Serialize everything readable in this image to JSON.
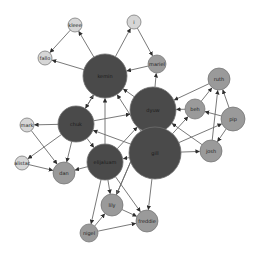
{
  "diagram": {
    "type": "directed-network-graph",
    "colors": {
      "hub": "#4a4a4a",
      "medium": "#9a9a9a",
      "light": "#d6d6d6",
      "stroke": "#6e6e6e",
      "edge": "#6a6a6a"
    },
    "nodes": [
      {
        "id": "kemin",
        "label": "kemin",
        "x": 105,
        "y": 76,
        "r": 22,
        "tier": "hub"
      },
      {
        "id": "dyuw",
        "label": "dyuw",
        "x": 153,
        "y": 110,
        "r": 23,
        "tier": "hub"
      },
      {
        "id": "chuk",
        "label": "chuk",
        "x": 76,
        "y": 124,
        "r": 18,
        "tier": "hub"
      },
      {
        "id": "elijaluam",
        "label": "elijaluam",
        "x": 105,
        "y": 162,
        "r": 18,
        "tier": "hub"
      },
      {
        "id": "gill",
        "label": "gill",
        "x": 155,
        "y": 153,
        "r": 26,
        "tier": "hub"
      },
      {
        "id": "kleee",
        "label": "kleee",
        "x": 75,
        "y": 25,
        "r": 7,
        "tier": "light"
      },
      {
        "id": "fallo",
        "label": "fallo",
        "x": 45,
        "y": 58,
        "r": 7,
        "tier": "light"
      },
      {
        "id": "i",
        "label": "i",
        "x": 134,
        "y": 22,
        "r": 7,
        "tier": "light"
      },
      {
        "id": "mariel",
        "label": "mariel",
        "x": 157,
        "y": 64,
        "r": 9,
        "tier": "medium"
      },
      {
        "id": "ruth",
        "label": "ruth",
        "x": 219,
        "y": 79,
        "r": 11,
        "tier": "medium"
      },
      {
        "id": "beh",
        "label": "beh",
        "x": 195,
        "y": 109,
        "r": 10,
        "tier": "medium"
      },
      {
        "id": "pip",
        "label": "pip",
        "x": 233,
        "y": 119,
        "r": 12,
        "tier": "medium"
      },
      {
        "id": "josh",
        "label": "josh",
        "x": 211,
        "y": 151,
        "r": 11,
        "tier": "medium"
      },
      {
        "id": "mark",
        "label": "mark",
        "x": 27,
        "y": 125,
        "r": 7,
        "tier": "light"
      },
      {
        "id": "alistar",
        "label": "alistar",
        "x": 22,
        "y": 163,
        "r": 7,
        "tier": "light"
      },
      {
        "id": "dan",
        "label": "dan",
        "x": 64,
        "y": 173,
        "r": 11,
        "tier": "medium"
      },
      {
        "id": "lily",
        "label": "lily",
        "x": 112,
        "y": 205,
        "r": 11,
        "tier": "medium"
      },
      {
        "id": "nigel",
        "label": "nigel",
        "x": 89,
        "y": 233,
        "r": 9,
        "tier": "medium"
      },
      {
        "id": "freddie",
        "label": "freddie",
        "x": 147,
        "y": 221,
        "r": 11,
        "tier": "medium"
      }
    ],
    "edges": [
      {
        "from": "kleee",
        "to": "fallo"
      },
      {
        "from": "kemin",
        "to": "fallo"
      },
      {
        "from": "kemin",
        "to": "kleee"
      },
      {
        "from": "kemin",
        "to": "i"
      },
      {
        "from": "i",
        "to": "mariel"
      },
      {
        "from": "mariel",
        "to": "kemin"
      },
      {
        "from": "dyuw",
        "to": "mariel"
      },
      {
        "from": "dyuw",
        "to": "kemin"
      },
      {
        "from": "chuk",
        "to": "kemin"
      },
      {
        "from": "elijaluam",
        "to": "kemin"
      },
      {
        "from": "gill",
        "to": "kemin"
      },
      {
        "from": "kemin",
        "to": "chuk"
      },
      {
        "from": "chuk",
        "to": "dyuw"
      },
      {
        "from": "chuk",
        "to": "mark"
      },
      {
        "from": "chuk",
        "to": "alistar"
      },
      {
        "from": "chuk",
        "to": "dan"
      },
      {
        "from": "chuk",
        "to": "elijaluam"
      },
      {
        "from": "mark",
        "to": "dan"
      },
      {
        "from": "alistar",
        "to": "dan"
      },
      {
        "from": "elijaluam",
        "to": "dan"
      },
      {
        "from": "elijaluam",
        "to": "dyuw"
      },
      {
        "from": "gill",
        "to": "chuk"
      },
      {
        "from": "gill",
        "to": "dyuw"
      },
      {
        "from": "gill",
        "to": "elijaluam"
      },
      {
        "from": "gill",
        "to": "josh"
      },
      {
        "from": "gill",
        "to": "pip"
      },
      {
        "from": "gill",
        "to": "beh"
      },
      {
        "from": "gill",
        "to": "freddie"
      },
      {
        "from": "ruth",
        "to": "dyuw"
      },
      {
        "from": "beh",
        "to": "ruth"
      },
      {
        "from": "beh",
        "to": "dyuw"
      },
      {
        "from": "pip",
        "to": "ruth"
      },
      {
        "from": "pip",
        "to": "beh"
      },
      {
        "from": "pip",
        "to": "josh"
      },
      {
        "from": "josh",
        "to": "ruth"
      },
      {
        "from": "josh",
        "to": "dyuw"
      },
      {
        "from": "elijaluam",
        "to": "lily"
      },
      {
        "from": "elijaluam",
        "to": "nigel"
      },
      {
        "from": "elijaluam",
        "to": "freddie"
      },
      {
        "from": "lily",
        "to": "freddie"
      },
      {
        "from": "nigel",
        "to": "lily"
      },
      {
        "from": "nigel",
        "to": "freddie"
      },
      {
        "from": "dyuw",
        "to": "lily"
      },
      {
        "from": "lily",
        "to": "dyuw"
      }
    ]
  }
}
